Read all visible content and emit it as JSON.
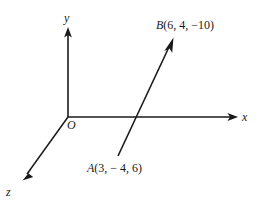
{
  "figure": {
    "name": "3d-coordinate-axes-with-vector",
    "background_color": "#ffffff",
    "stroke_color": "#1a1a1a",
    "width": 263,
    "height": 208
  },
  "axes": [
    {
      "id": "y",
      "label": "y",
      "icon": "axis-arrow-icon",
      "direction": "up",
      "from": [
        68,
        117
      ],
      "to": [
        68,
        28
      ]
    },
    {
      "id": "x",
      "label": "x",
      "icon": "axis-arrow-icon",
      "direction": "right",
      "from": [
        68,
        117
      ],
      "to": [
        237,
        117
      ]
    },
    {
      "id": "z",
      "label": "z",
      "icon": "axis-arrow-icon",
      "direction": "down-left",
      "from": [
        68,
        117
      ],
      "to": [
        23,
        180
      ]
    }
  ],
  "origin": {
    "label": "O",
    "position": [
      68,
      117
    ]
  },
  "vector": {
    "name": "vector-AB",
    "icon": "vector-arrow-icon",
    "tail": [
      118,
      156
    ],
    "head": [
      173,
      38
    ],
    "crosses_x_axis_at": [
      136,
      117
    ]
  },
  "points": [
    {
      "id": "B",
      "name": "B",
      "coords_text": "(6, 4, −10)",
      "full_label": "B(6, 4, −10)",
      "x": 6,
      "y": 4,
      "z": -10
    },
    {
      "id": "A",
      "name": "A",
      "coords_text": "(3, − 4, 6)",
      "full_label": "A(3, − 4, 6)",
      "x": 3,
      "y": -4,
      "z": 6
    }
  ]
}
